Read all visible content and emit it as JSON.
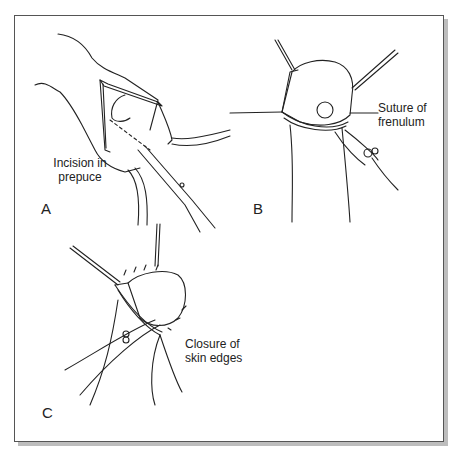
{
  "figure": {
    "panels": [
      {
        "letter": "A",
        "caption_line1": "Incision in",
        "caption_line2": "prepuce"
      },
      {
        "letter": "B",
        "caption_line1": "Suture of",
        "caption_line2": "frenulum"
      },
      {
        "letter": "C",
        "caption_line1": "Closure of",
        "caption_line2": "skin edges"
      }
    ]
  }
}
